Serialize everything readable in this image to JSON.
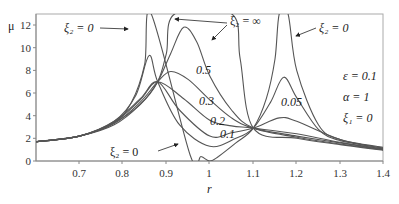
{
  "chart_data": {
    "type": "line",
    "title": "",
    "xlabel": "r",
    "ylabel": "μ",
    "xlim": [
      0.6,
      1.4
    ],
    "ylim": [
      0,
      13
    ],
    "xticks": [
      "0.7",
      "0.8",
      "0.9",
      "1",
      "1.1",
      "1.2",
      "1.3",
      "1.4"
    ],
    "yticks": [
      "0",
      "2",
      "4",
      "6",
      "8",
      "10",
      "12"
    ],
    "grid": false,
    "legend": "none (inline annotations)",
    "parameters": [
      "ε = 0.1",
      "α = 1",
      "ξ1 = 0"
    ],
    "annotations": [
      {
        "text": "ξ2 = 0",
        "at": "top-left, arrow to left resonance branch"
      },
      {
        "text": "ξ2 = ∞",
        "at": "top-middle, arrows to two branches"
      },
      {
        "text": "ξ2 = 0",
        "at": "top-right, arrow to right resonance branch"
      },
      {
        "text": "ξ2 = 0",
        "at": "bottom, arrow to cusp curve at r=1"
      },
      {
        "text": "0.5"
      },
      {
        "text": "0.3"
      },
      {
        "text": "0.2"
      },
      {
        "text": "0.1"
      },
      {
        "text": "0.05"
      }
    ],
    "fixed_points": [
      {
        "r": 0.88,
        "mu": 7.0
      },
      {
        "r": 1.1,
        "mu": 2.9
      }
    ],
    "series": [
      {
        "name": "ξ2 = 0",
        "points": [
          [
            0.6,
            1.7
          ],
          [
            0.7,
            2.2
          ],
          [
            0.78,
            3.4
          ],
          [
            0.82,
            5.2
          ],
          [
            0.85,
            8.5
          ],
          [
            0.865,
            13
          ],
          [
            0.955,
            0.5
          ],
          [
            0.98,
            0.4
          ],
          [
            1.0,
            0.0
          ],
          [
            1.02,
            0.4
          ],
          [
            1.06,
            1.6
          ],
          [
            1.1,
            2.9
          ],
          [
            1.13,
            5.5
          ],
          [
            1.15,
            9
          ],
          [
            1.16,
            13
          ],
          [
            1.18,
            13
          ],
          [
            1.2,
            8
          ],
          [
            1.25,
            3.2
          ],
          [
            1.3,
            1.9
          ],
          [
            1.4,
            1.2
          ]
        ]
      },
      {
        "name": "ξ2 = 0.05",
        "points": [
          [
            0.6,
            1.7
          ],
          [
            0.7,
            2.2
          ],
          [
            0.78,
            3.5
          ],
          [
            0.83,
            5.8
          ],
          [
            0.86,
            9.3
          ],
          [
            0.88,
            7.0
          ],
          [
            0.93,
            3.2
          ],
          [
            1.0,
            1.3
          ],
          [
            1.06,
            2.0
          ],
          [
            1.1,
            2.9
          ],
          [
            1.14,
            5.2
          ],
          [
            1.17,
            7.4
          ],
          [
            1.2,
            5.6
          ],
          [
            1.25,
            2.8
          ],
          [
            1.3,
            1.8
          ],
          [
            1.4,
            1.15
          ]
        ]
      },
      {
        "name": "ξ2 = 0.1",
        "points": [
          [
            0.6,
            1.7
          ],
          [
            0.7,
            2.2
          ],
          [
            0.78,
            3.5
          ],
          [
            0.84,
            5.5
          ],
          [
            0.88,
            7.0
          ],
          [
            0.93,
            4.5
          ],
          [
            1.0,
            2.2
          ],
          [
            1.05,
            2.5
          ],
          [
            1.1,
            2.9
          ],
          [
            1.16,
            3.8
          ],
          [
            1.2,
            3.5
          ],
          [
            1.3,
            1.9
          ],
          [
            1.4,
            1.1
          ]
        ]
      },
      {
        "name": "ξ2 = 0.2",
        "points": [
          [
            0.6,
            1.7
          ],
          [
            0.7,
            2.2
          ],
          [
            0.78,
            3.4
          ],
          [
            0.84,
            5.4
          ],
          [
            0.88,
            7.0
          ],
          [
            0.94,
            5.5
          ],
          [
            1.0,
            3.6
          ],
          [
            1.05,
            3.1
          ],
          [
            1.1,
            2.9
          ],
          [
            1.2,
            2.4
          ],
          [
            1.3,
            1.65
          ],
          [
            1.4,
            1.05
          ]
        ]
      },
      {
        "name": "ξ2 = 0.3",
        "points": [
          [
            0.6,
            1.7
          ],
          [
            0.7,
            2.2
          ],
          [
            0.78,
            3.3
          ],
          [
            0.84,
            5.2
          ],
          [
            0.88,
            7.0
          ],
          [
            0.91,
            7.9
          ],
          [
            0.95,
            7.2
          ],
          [
            1.0,
            5.4
          ],
          [
            1.05,
            3.8
          ],
          [
            1.1,
            2.9
          ],
          [
            1.2,
            2.2
          ],
          [
            1.3,
            1.6
          ],
          [
            1.4,
            1.0
          ]
        ]
      },
      {
        "name": "ξ2 = 0.5",
        "points": [
          [
            0.6,
            1.7
          ],
          [
            0.7,
            2.2
          ],
          [
            0.78,
            3.2
          ],
          [
            0.84,
            5.0
          ],
          [
            0.88,
            7.0
          ],
          [
            0.91,
            9.5
          ],
          [
            0.94,
            11.8
          ],
          [
            0.97,
            10.5
          ],
          [
            1.0,
            7.5
          ],
          [
            1.05,
            4.5
          ],
          [
            1.1,
            2.9
          ],
          [
            1.2,
            2.1
          ],
          [
            1.3,
            1.5
          ],
          [
            1.4,
            1.0
          ]
        ]
      },
      {
        "name": "ξ2 = ∞",
        "points": [
          [
            0.6,
            1.7
          ],
          [
            0.7,
            2.2
          ],
          [
            0.78,
            3.4
          ],
          [
            0.84,
            5.0
          ],
          [
            0.88,
            7.0
          ],
          [
            0.9,
            9.5
          ],
          [
            0.92,
            13
          ],
          [
            1.05,
            13
          ],
          [
            1.07,
            9.0
          ],
          [
            1.1,
            2.9
          ],
          [
            1.2,
            2.0
          ],
          [
            1.3,
            1.45
          ],
          [
            1.4,
            0.95
          ]
        ]
      }
    ]
  },
  "labels": {
    "y_axis": "μ",
    "x_axis": "r",
    "xi2_zero_left": "ξ₂ = 0",
    "xi2_inf": "ξ₂ = ∞",
    "xi2_zero_right": "ξ₂ = 0",
    "xi2_zero_bottom": "ξ₂ = 0",
    "eps": "ε = 0.1",
    "alpha": "α = 1",
    "xi1": "ξ₁ = 0",
    "c05": "0.5",
    "c03": "0.3",
    "c02": "0.2",
    "c01": "0.1",
    "c005": "0.05"
  },
  "ticks": {
    "x": [
      "0.7",
      "0.8",
      "0.9",
      "1",
      "1.1",
      "1.2",
      "1.3",
      "1.4"
    ],
    "y": [
      "0",
      "2",
      "4",
      "6",
      "8",
      "10",
      "12"
    ]
  }
}
